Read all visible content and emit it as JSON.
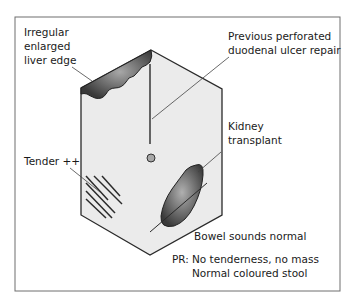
{
  "diagram": {
    "type": "abdominal-examination-findings",
    "colors": {
      "frame": "#6e6e6e",
      "abdomen_fill": "#ebebeb",
      "outline": "#2a2a2a",
      "organ_dark": "#3c3c3c",
      "organ_highlight": "#9a9a9a",
      "text": "#1a1a1a"
    },
    "labels": {
      "liver": [
        "Irregular",
        "enlarged",
        "liver edge"
      ],
      "scar": [
        "Previous perforated",
        "duodenal ulcer repair"
      ],
      "kidney": [
        "Kidney",
        "transplant"
      ],
      "tender": "Tender ++",
      "bowel": "Bowel sounds normal",
      "pr_prefix": "PR:",
      "pr_line1": "No tenderness, no mass",
      "pr_line2": "Normal coloured stool"
    }
  }
}
